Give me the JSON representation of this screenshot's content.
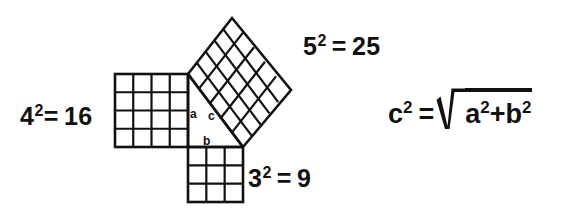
{
  "diagram": {
    "background_color": "#ffffff",
    "line_color": "#111111",
    "text_color": "#111111",
    "labels": {
      "square_a": {
        "base": "4",
        "exponent": "2",
        "equals": "=",
        "result": "16"
      },
      "square_b": {
        "base": "3",
        "exponent": "2",
        "equals": "=",
        "result": "9"
      },
      "square_c": {
        "base": "5",
        "exponent": "2",
        "equals": "=",
        "result": "25"
      },
      "leg_a": "a",
      "leg_b": "b",
      "leg_c": "c"
    },
    "formula": {
      "lhs_base": "c",
      "lhs_exponent": "2",
      "equals": "=",
      "radicand_first_base": "a",
      "radicand_first_exponent": "2",
      "plus": "+",
      "radicand_second_base": "b",
      "radicand_second_exponent": "2"
    },
    "geometry": {
      "triangle": {
        "vertices": [
          [
            188,
            147
          ],
          [
            188,
            74
          ],
          [
            243,
            147
          ]
        ],
        "right_angle_at": [
          188,
          147
        ],
        "leg_a_length": 4,
        "leg_b_length": 3,
        "hypotenuse_length": 5
      },
      "square_on_leg_a": {
        "side_label": "4",
        "grid": 4,
        "corners": [
          [
            115,
            74
          ],
          [
            188,
            74
          ],
          [
            188,
            147
          ],
          [
            115,
            147
          ]
        ]
      },
      "square_on_leg_b": {
        "side_label": "3",
        "grid": 3,
        "corners": [
          [
            188,
            147
          ],
          [
            243,
            147
          ],
          [
            243,
            202
          ],
          [
            188,
            202
          ]
        ]
      },
      "square_on_hypotenuse": {
        "side_label": "5",
        "grid": 5,
        "corners": [
          [
            188,
            74
          ],
          [
            232,
            18
          ],
          [
            291,
            90
          ],
          [
            243,
            147
          ]
        ]
      }
    }
  }
}
